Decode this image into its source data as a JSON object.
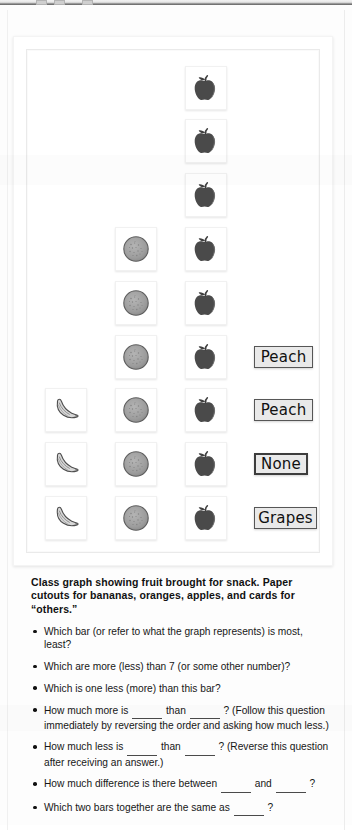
{
  "page": {
    "background_color": "#fdfdfd",
    "frame_color": "#ffffff"
  },
  "chart_data": {
    "type": "bar",
    "orientation": "vertical-pictograph",
    "title": "Class graph showing fruit brought for snack",
    "categories": [
      "Bananas",
      "Oranges",
      "Apples",
      "Others (cards)"
    ],
    "values": [
      3,
      6,
      9,
      4
    ],
    "xlabel": "",
    "ylabel": "Number of pieces",
    "ylim": [
      0,
      9
    ],
    "grid": false,
    "legend": "none",
    "icons": [
      "banana-icon",
      "orange-icon",
      "apple-icon",
      "card-label"
    ]
  },
  "graph": {
    "columns": [
      {
        "name": "bananas",
        "icon": "banana-icon",
        "count": 3
      },
      {
        "name": "oranges",
        "icon": "orange-icon",
        "count": 6
      },
      {
        "name": "apples",
        "icon": "apple-icon",
        "count": 9
      }
    ],
    "cards": [
      {
        "label": "Peach",
        "style": "thin"
      },
      {
        "label": "Peach",
        "style": "thin"
      },
      {
        "label": "None",
        "style": "thick"
      },
      {
        "label": "Grapes",
        "style": "thin"
      }
    ]
  },
  "text": {
    "caption": "Class graph showing fruit brought for snack. Paper cutouts for bananas, oranges, apples, and cards for “others.”",
    "questions": [
      {
        "parts": [
          "Which bar (or refer to what the graph represents) is most, least?"
        ]
      },
      {
        "parts": [
          "Which are more (less) than 7 (or some other number)?"
        ]
      },
      {
        "parts": [
          "Which is one less (more) than this bar?"
        ]
      },
      {
        "parts": [
          "How much more is ",
          "BLANK",
          " than ",
          "BLANK",
          " ? (Follow this question immediately by reversing the order and asking how much less.)"
        ]
      },
      {
        "parts": [
          "How much less is ",
          "BLANK",
          " than ",
          "BLANK",
          " ? (Reverse this question after receiving an answer.)"
        ]
      },
      {
        "parts": [
          "How much difference is there between ",
          "BLANK",
          " and ",
          "BLANK",
          " ?"
        ]
      },
      {
        "parts": [
          "Which two bars together are the same as ",
          "BLANK",
          " ?"
        ]
      }
    ]
  }
}
